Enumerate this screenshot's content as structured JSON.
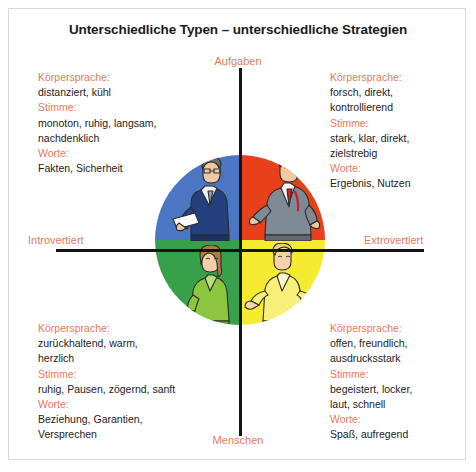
{
  "title": "Unterschiedliche Typen – unterschiedliche Strategien",
  "axes": {
    "top": "Aufgaben",
    "bottom": "Menschen",
    "left": "Introvertiert",
    "right": "Extrovertiert"
  },
  "colors": {
    "heading": "#e8795c",
    "body": "#222222",
    "quadrant_top_left": "#4a76c4",
    "quadrant_top_right": "#e8401a",
    "quadrant_bottom_left": "#37a04a",
    "quadrant_bottom_right": "#f5eb30",
    "axis": "#141414",
    "frame": "#d8d8d8"
  },
  "quadrants": {
    "top_left": {
      "name": "Analytiker",
      "color": "#4a76c4",
      "sections": [
        {
          "heading": "Körpersprache:",
          "lines": [
            "distanziert, kühl"
          ]
        },
        {
          "heading": "Stimme:",
          "lines": [
            "monoton, ruhig, langsam,",
            "nachdenklich"
          ]
        },
        {
          "heading": "Worte:",
          "lines": [
            "Fakten, Sicherheit"
          ]
        }
      ]
    },
    "top_right": {
      "name": "Macher",
      "color": "#e8401a",
      "sections": [
        {
          "heading": "Körpersprache:",
          "lines": [
            "forsch, direkt,",
            "kontrollierend"
          ]
        },
        {
          "heading": "Stimme:",
          "lines": [
            "stark, klar, direkt,",
            "zielstrebig"
          ]
        },
        {
          "heading": "Worte:",
          "lines": [
            "Ergebnis, Nutzen"
          ]
        }
      ]
    },
    "bottom_left": {
      "name": "Bewahrer",
      "color": "#37a04a",
      "sections": [
        {
          "heading": "Körpersprache:",
          "lines": [
            "zurückhaltend, warm,",
            "herzlich"
          ]
        },
        {
          "heading": "Stimme:",
          "lines": [
            "ruhig, Pausen, zögernd, sanft"
          ]
        },
        {
          "heading": "Worte:",
          "lines": [
            "Beziehung, Garantien,",
            "Versprechen"
          ]
        }
      ]
    },
    "bottom_right": {
      "name": "Expressiver",
      "color": "#f5eb30",
      "sections": [
        {
          "heading": "Körpersprache:",
          "lines": [
            "offen, freundlich,",
            "ausdrucksstark"
          ]
        },
        {
          "heading": "Stimme:",
          "lines": [
            "begeistert, locker,",
            "laut, schnell"
          ]
        },
        {
          "heading": "Worte:",
          "lines": [
            "Spaß, aufregend"
          ]
        }
      ]
    }
  }
}
